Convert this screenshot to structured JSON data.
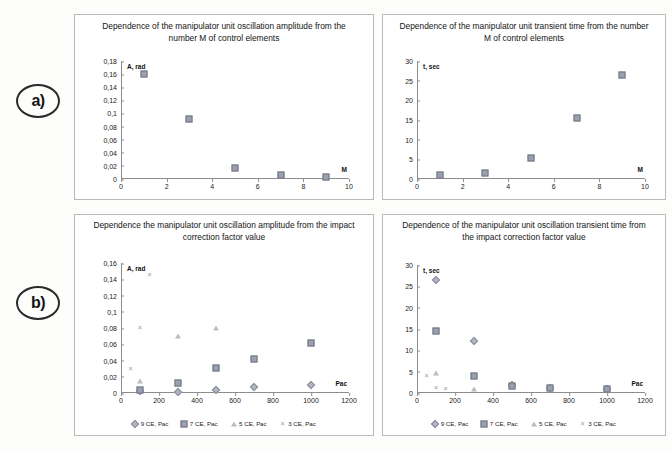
{
  "figure": {
    "row_labels": [
      {
        "id": "a",
        "text": "a)"
      },
      {
        "id": "b",
        "text": "b)"
      }
    ]
  },
  "axis_names": {
    "amplitude": "A, rad",
    "time": "t, sec",
    "m": "M",
    "pac": "Рас"
  },
  "legend": {
    "items": [
      {
        "label": "9 CE, Рас",
        "marker": "diamond"
      },
      {
        "label": "7 CE, Рас",
        "marker": "square"
      },
      {
        "label": "5 CE, Рас",
        "marker": "triangle"
      },
      {
        "label": "3 CE, Рас",
        "marker": "cross"
      }
    ]
  },
  "chart_data": [
    {
      "id": "top-left",
      "type": "scatter",
      "title": "Dependence of the manipulator unit oscillation amplitude from the number M of control elements",
      "xlabel": "M",
      "ylabel": "A, rad",
      "xlim": [
        0,
        10
      ],
      "ylim": [
        0,
        0.18
      ],
      "xticks": [
        0,
        2,
        4,
        6,
        8,
        10
      ],
      "xtick_labels": [
        "0",
        "2",
        "4",
        "6",
        "8",
        "10"
      ],
      "yticks": [
        0,
        0.02,
        0.04,
        0.06,
        0.08,
        0.1,
        0.12,
        0.14,
        0.16,
        0.18
      ],
      "ytick_labels": [
        "0",
        "0,02",
        "0,04",
        "0,06",
        "0,08",
        "0,1",
        "0,12",
        "0,14",
        "0,16",
        "0,18"
      ],
      "grid": false,
      "legend": false,
      "series": [
        {
          "name": "amplitude",
          "marker": "square",
          "x": [
            1,
            3,
            5,
            7,
            9
          ],
          "y": [
            0.16,
            0.091,
            0.0165,
            0.006,
            0.0028
          ]
        }
      ]
    },
    {
      "id": "top-right",
      "type": "scatter",
      "title": "Dependence of the manipulator unit transient time from the number M of control elements",
      "xlabel": "M",
      "ylabel": "t, sec",
      "xlim": [
        0,
        10
      ],
      "ylim": [
        0,
        30
      ],
      "xticks": [
        0,
        2,
        4,
        6,
        8,
        10
      ],
      "xtick_labels": [
        "0",
        "2",
        "4",
        "6",
        "8",
        "10"
      ],
      "yticks": [
        0,
        5,
        10,
        15,
        20,
        25,
        30
      ],
      "ytick_labels": [
        "0",
        "5",
        "10",
        "15",
        "20",
        "25",
        "30"
      ],
      "grid": false,
      "legend": false,
      "series": [
        {
          "name": "transient time",
          "marker": "square",
          "x": [
            1,
            3,
            5,
            7,
            9
          ],
          "y": [
            0.9,
            1.4,
            5.3,
            15.6,
            26.5
          ]
        }
      ]
    },
    {
      "id": "bottom-left",
      "type": "scatter",
      "title": "Dependence the manipulator unit oscillation amplitude from the impact correction factor value",
      "xlabel": "Рас",
      "ylabel": "A, rad",
      "xlim": [
        0,
        1200
      ],
      "ylim": [
        0,
        0.16
      ],
      "xticks": [
        0,
        200,
        400,
        600,
        800,
        1000,
        1200
      ],
      "xtick_labels": [
        "0",
        "200",
        "400",
        "600",
        "800",
        "1000",
        "1200"
      ],
      "yticks": [
        0,
        0.02,
        0.04,
        0.06,
        0.08,
        0.1,
        0.12,
        0.14,
        0.16
      ],
      "ytick_labels": [
        "0",
        "0,02",
        "0,04",
        "0,06",
        "0,08",
        "0,1",
        "0,12",
        "0,14",
        "0,16"
      ],
      "grid": false,
      "legend": true,
      "series": [
        {
          "name": "9 CE, Рас",
          "marker": "diamond",
          "x": [
            100,
            300,
            500,
            700,
            1000
          ],
          "y": [
            0.002,
            0.0015,
            0.004,
            0.008,
            0.01
          ]
        },
        {
          "name": "7 CE, Рас",
          "marker": "square",
          "x": [
            100,
            300,
            500,
            700,
            1000
          ],
          "y": [
            0.004,
            0.0125,
            0.031,
            0.042,
            0.062
          ]
        },
        {
          "name": "5 CE, Рас",
          "marker": "triangle",
          "x": [
            100,
            300,
            500
          ],
          "y": [
            0.015,
            0.07,
            0.08
          ]
        },
        {
          "name": "3 CE, Рас",
          "marker": "cross",
          "x": [
            50,
            100,
            150
          ],
          "y": [
            0.03,
            0.08,
            0.145
          ]
        }
      ]
    },
    {
      "id": "bottom-right",
      "type": "scatter",
      "title": "Dependence of the manipulator unit oscillation transient time from the impact correction factor value",
      "xlabel": "Рас",
      "ylabel": "t, sec",
      "xlim": [
        0,
        1200
      ],
      "ylim": [
        0,
        30
      ],
      "xticks": [
        0,
        200,
        400,
        600,
        800,
        1000,
        1200
      ],
      "xtick_labels": [
        "0",
        "200",
        "400",
        "600",
        "800",
        "1000",
        "1200"
      ],
      "yticks": [
        0,
        5,
        10,
        15,
        20,
        25,
        30
      ],
      "ytick_labels": [
        "0",
        "5",
        "10",
        "15",
        "20",
        "25",
        "30"
      ],
      "grid": false,
      "legend": true,
      "series": [
        {
          "name": "9 CE, Рас",
          "marker": "diamond",
          "x": [
            100,
            300,
            500,
            700,
            1000
          ],
          "y": [
            26.5,
            12.2,
            1.8,
            1.2,
            1.0
          ]
        },
        {
          "name": "7 CE, Рас",
          "marker": "square",
          "x": [
            100,
            300,
            500,
            700,
            1000
          ],
          "y": [
            14.6,
            3.9,
            1.6,
            1.1,
            0.9
          ]
        },
        {
          "name": "5 CE, Рас",
          "marker": "triangle",
          "x": [
            100,
            300
          ],
          "y": [
            4.6,
            0.9
          ]
        },
        {
          "name": "3 CE, Рас",
          "marker": "cross",
          "x": [
            50,
            100,
            150
          ],
          "y": [
            4.0,
            1.1,
            0.9
          ]
        }
      ]
    }
  ]
}
